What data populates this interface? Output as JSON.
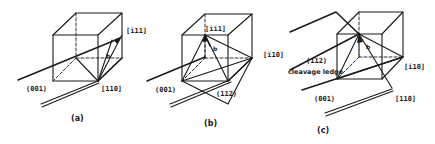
{
  "figure": {
    "panels": [
      {
        "id": "a",
        "caption": "(a)",
        "labels": {
          "direction_top": "[ī11]",
          "direction_bottom": "[110]",
          "plane": "(001)",
          "burgers": "b"
        }
      },
      {
        "id": "b",
        "caption": "(b)",
        "labels": {
          "direction_top": "[īī1]",
          "plane_bottom": "(112)",
          "plane": "(001)",
          "burgers": "b"
        }
      },
      {
        "id": "c",
        "caption": "(c)",
        "labels": {
          "direction_left": "[ī10]",
          "plane_upper": "(112)",
          "ledge": "cleavage ledge",
          "plane": "(001)",
          "direction_right": "[ī10]",
          "direction_bottom": "[110]",
          "burgers": "b"
        }
      }
    ]
  }
}
